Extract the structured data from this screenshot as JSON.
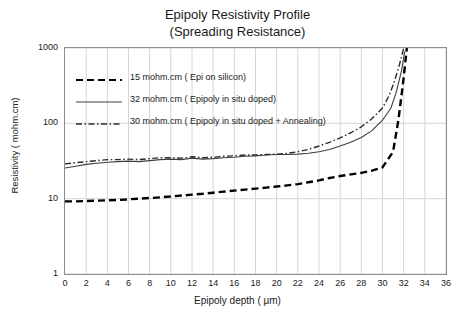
{
  "chart_data": {
    "type": "line",
    "title": "Epipoly Resistivity Profile",
    "subtitle": "(Spreading Resistance)",
    "xlabel": "Epipoly depth ( μm)",
    "ylabel": "Resistivity ( mohm.cm)",
    "xlim": [
      0,
      36
    ],
    "ylim": [
      1,
      1000
    ],
    "yscale": "log",
    "grid": true,
    "legend_position": "inside-upper-left",
    "xticks": [
      0,
      2,
      4,
      6,
      8,
      10,
      12,
      14,
      16,
      18,
      20,
      22,
      24,
      26,
      28,
      30,
      32,
      34,
      36
    ],
    "yticks": [
      1,
      10,
      100,
      1000
    ],
    "series": [
      {
        "name": "15 mohm.cm ( Epi on silicon)",
        "style": "dashed",
        "color": "#000000",
        "x": [
          0,
          1,
          2,
          3,
          4,
          5,
          6,
          7,
          8,
          9,
          10,
          11,
          12,
          13,
          14,
          15,
          16,
          17,
          18,
          19,
          20,
          21,
          22,
          23,
          24,
          25,
          26,
          27,
          28,
          29,
          30,
          31,
          31.5,
          32,
          32.3
        ],
        "y": [
          9.2,
          9.2,
          9.3,
          9.4,
          9.5,
          9.6,
          9.8,
          10.0,
          10.2,
          10.4,
          10.7,
          11.0,
          11.3,
          11.6,
          12.0,
          12.4,
          12.8,
          13.2,
          13.6,
          14.0,
          14.5,
          15.0,
          15.6,
          16.5,
          17.5,
          18.8,
          20.0,
          21.0,
          22.0,
          23.5,
          26.0,
          42,
          110,
          400,
          1000
        ]
      },
      {
        "name": "32 mohm.cm  ( Epipoly in situ doped)",
        "style": "solid",
        "color": "#3f3f3f",
        "x": [
          0,
          1,
          2,
          3,
          4,
          5,
          6,
          7,
          8,
          9,
          10,
          11,
          12,
          13,
          14,
          15,
          16,
          17,
          18,
          19,
          20,
          21,
          22,
          23,
          24,
          25,
          26,
          27,
          28,
          29,
          30,
          30.8,
          31.3,
          31.8,
          32.1
        ],
        "y": [
          25.5,
          27.0,
          28.5,
          29.5,
          30.5,
          31.0,
          31.5,
          31.0,
          32.0,
          33.0,
          33.5,
          33.0,
          34.5,
          33.5,
          34.0,
          35.0,
          35.5,
          36.5,
          37.0,
          38.0,
          38.5,
          38.5,
          39.0,
          40.0,
          42.0,
          45.0,
          50.0,
          56.0,
          65.0,
          80.0,
          110.0,
          160,
          260,
          500,
          900
        ]
      },
      {
        "name": "30 mohm.cm  ( Epipoly in situ doped + Annealing)",
        "style": "dash-dot",
        "color": "#2b2b2b",
        "x": [
          0,
          1,
          2,
          3,
          4,
          5,
          6,
          7,
          8,
          9,
          10,
          11,
          12,
          13,
          14,
          15,
          16,
          17,
          18,
          19,
          20,
          21,
          22,
          23,
          24,
          25,
          26,
          27,
          28,
          29,
          30,
          30.6,
          31.1,
          31.6,
          32.0
        ],
        "y": [
          29.0,
          30.0,
          31.0,
          32.0,
          33.0,
          33.0,
          33.5,
          33.0,
          34.0,
          35.0,
          35.0,
          34.5,
          36.0,
          35.0,
          35.5,
          36.5,
          37.0,
          38.0,
          38.0,
          38.5,
          39.0,
          40.0,
          42.0,
          45.0,
          50.0,
          56.0,
          64.0,
          75.0,
          90.0,
          115.0,
          160.0,
          230,
          350,
          600,
          1000
        ]
      }
    ]
  }
}
